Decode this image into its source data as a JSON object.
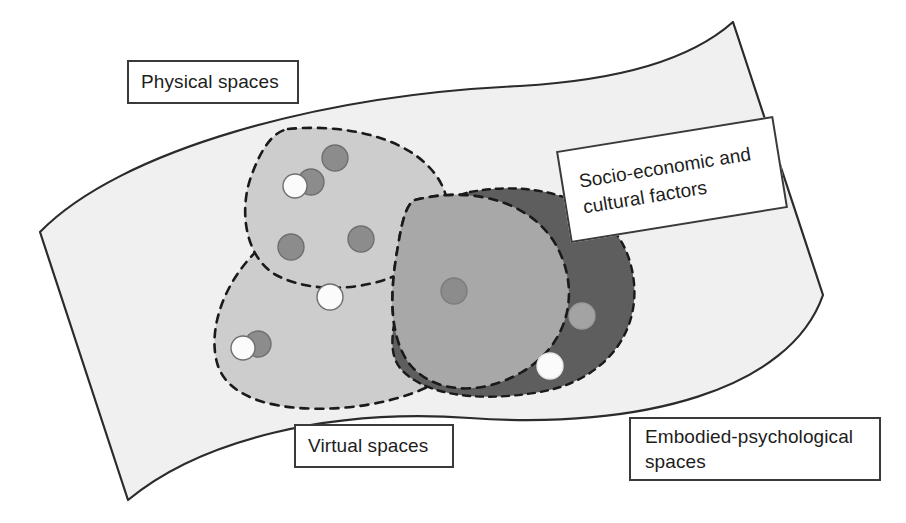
{
  "diagram": {
    "background_color": "#ffffff",
    "outer_region": {
      "name": "Physical spaces",
      "fill": "#f0f0f0",
      "stroke": "#2b2b2b",
      "stroke_width": 2,
      "description": "Large curved quadrilateral container"
    },
    "labels": [
      {
        "id": "physical",
        "text": "Physical spaces",
        "rotation_deg": 0,
        "border_color": "#3a3a3a",
        "text_color": "#1d1d1d"
      },
      {
        "id": "socio",
        "text": "Socio-economic and\ncultural factors",
        "rotation_deg": -9.2,
        "border_color": "#3a3a3a",
        "text_color": "#1d1d1d"
      },
      {
        "id": "virtual",
        "text": "Virtual spaces",
        "rotation_deg": 0,
        "border_color": "#3a3a3a",
        "text_color": "#1d1d1d"
      },
      {
        "id": "embodied",
        "text": "Embodied-psychological\nspaces",
        "rotation_deg": 0,
        "border_color": "#3a3a3a",
        "text_color": "#1d1d1d"
      }
    ],
    "regions": [
      {
        "id": "region-light-upper",
        "label": "upper light-gray lobe",
        "fill": "#cdcdcd",
        "border_style": "dashed",
        "border_color": "#1a1a1a"
      },
      {
        "id": "region-light-lower",
        "label": "lower light-gray lobe",
        "fill": "#cdcdcd",
        "border_style": "dashed",
        "border_color": "#1a1a1a"
      },
      {
        "id": "region-mid-gray",
        "label": "middle medium-gray lobe",
        "fill": "#a8a8a8",
        "border_style": "dashed",
        "border_color": "#1a1a1a"
      },
      {
        "id": "region-dark-gray",
        "label": "right dark-gray lobe",
        "fill": "#5e5e5e",
        "border_style": "dashed",
        "border_color": "#1a1a1a"
      }
    ],
    "palette": {
      "white_dot": "#fbfbfb",
      "gray_dot": "#8c8c8c",
      "dark_dot": "#7a7a7a",
      "light_dot_on_dark": "#a5a5a5",
      "dot_stroke": "#6a6a6a"
    },
    "dots": [
      {
        "id": "dot-1",
        "cx": 335,
        "cy": 158,
        "r": 13,
        "fill": "#8c8c8c",
        "stroke": "#6f6f6f"
      },
      {
        "id": "dot-2",
        "cx": 311,
        "cy": 182,
        "r": 13,
        "fill": "#8c8c8c",
        "stroke": "#6f6f6f"
      },
      {
        "id": "dot-3",
        "cx": 295,
        "cy": 186,
        "r": 12,
        "fill": "#fbfbfb",
        "stroke": "#6f6f6f"
      },
      {
        "id": "dot-4",
        "cx": 291,
        "cy": 247,
        "r": 13,
        "fill": "#8c8c8c",
        "stroke": "#6f6f6f"
      },
      {
        "id": "dot-5",
        "cx": 361,
        "cy": 239,
        "r": 13,
        "fill": "#8c8c8c",
        "stroke": "#6f6f6f"
      },
      {
        "id": "dot-6",
        "cx": 330,
        "cy": 297,
        "r": 13,
        "fill": "#fbfbfb",
        "stroke": "#6f6f6f"
      },
      {
        "id": "dot-7",
        "cx": 258,
        "cy": 344,
        "r": 13,
        "fill": "#8c8c8c",
        "stroke": "#6f6f6f"
      },
      {
        "id": "dot-8",
        "cx": 243,
        "cy": 348,
        "r": 12,
        "fill": "#fbfbfb",
        "stroke": "#6f6f6f"
      },
      {
        "id": "dot-9",
        "cx": 454,
        "cy": 291,
        "r": 13,
        "fill": "#8c8c8c",
        "stroke": "#7c7c7c"
      },
      {
        "id": "dot-10",
        "cx": 582,
        "cy": 316,
        "r": 13,
        "fill": "#a3a3a3",
        "stroke": "#9a9a9a"
      },
      {
        "id": "dot-11",
        "cx": 550,
        "cy": 366,
        "r": 13,
        "fill": "#fbfbfb",
        "stroke": "#e8e8e8"
      }
    ]
  }
}
